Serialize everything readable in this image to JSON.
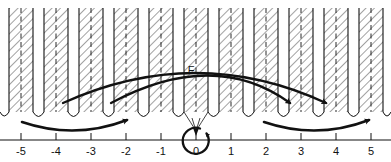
{
  "figure": {
    "title": "",
    "kind": "number-line-diagram-with-hatched-bands",
    "background_color": "#ffffff",
    "ink_color": "#111111",
    "hatch_color": "#8a8a8a",
    "width": 391,
    "height": 162
  },
  "axis": {
    "name": "number-line",
    "origin_x": 196,
    "unit_px": 35,
    "y": 140,
    "min": -5,
    "max": 5,
    "tick_labels": [
      "-5",
      "-4",
      "-3",
      "-2",
      "-1",
      "0",
      "1",
      "2",
      "3",
      "4",
      "5"
    ],
    "tick_values": [
      -5,
      -4,
      -3,
      -2,
      -1,
      0,
      1,
      2,
      3,
      4,
      5
    ],
    "tick_length": 7
  },
  "bands": {
    "name": "hatched-bands",
    "count": 11,
    "centers": [
      -5,
      -4,
      -3,
      -2,
      -1,
      0,
      1,
      2,
      3,
      4,
      5
    ],
    "half_width_px": 12,
    "top_y": 8,
    "bottom_y": 112,
    "hatch_angle_deg": 45,
    "center_line_style": "dashed",
    "edge_line_style": "solid"
  },
  "scallops": {
    "name": "scalloped-baseline",
    "y": 112,
    "arc_rise_px": 9,
    "description": "arcs dipping between adjacent bands"
  },
  "labels": {
    "f_point": {
      "text": "F",
      "x": 191,
      "y": 74
    }
  },
  "arcs": [
    {
      "name": "upper-long-arc",
      "start": {
        "x": 63,
        "y": 103
      },
      "apex": {
        "x": 200,
        "y": 62
      },
      "end": {
        "x": 326,
        "y": 103
      },
      "arrowhead": "end",
      "stroke_width": 2.2
    },
    {
      "name": "lower-short-arc",
      "start": {
        "x": 111,
        "y": 103
      },
      "apex": {
        "x": 215,
        "y": 64
      },
      "end": {
        "x": 290,
        "y": 103
      },
      "arrowhead": "end",
      "stroke_width": 2.2
    }
  ],
  "ground_arrows": [
    {
      "name": "left-sweep-arrow",
      "start": {
        "x": 22,
        "y": 122
      },
      "end": {
        "x": 128,
        "y": 119
      },
      "direction": "left-to-right",
      "arrowhead": "end"
    },
    {
      "name": "right-sweep-arrow",
      "start": {
        "x": 264,
        "y": 122
      },
      "end": {
        "x": 370,
        "y": 119
      },
      "direction": "left-to-right",
      "arrowhead": "end"
    }
  ],
  "origin_marker": {
    "name": "origin-loop-arrow",
    "center": {
      "x": 196,
      "y": 140
    },
    "radius": 13,
    "arrowhead": "top-right",
    "converging_lines": "two thin lines from band edges converging to origin"
  }
}
